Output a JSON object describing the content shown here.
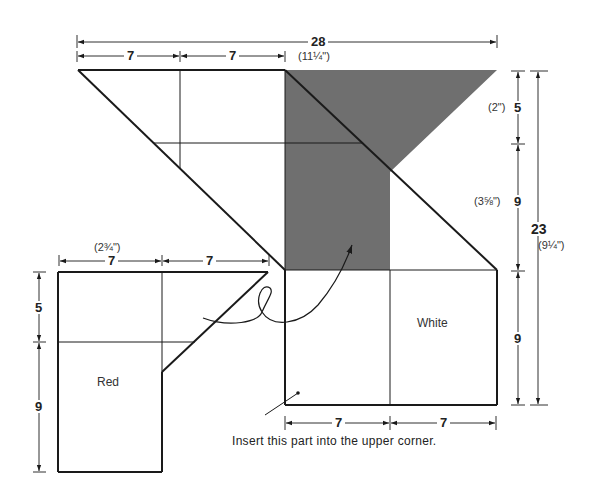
{
  "diagram": {
    "colors": {
      "line": "#1a1a1a",
      "shaded": "#6f6f6f",
      "background": "#ffffff"
    },
    "dimensions": {
      "top_total": "28",
      "top_total_inches": "(11¼\")",
      "top_left_segment": "7",
      "top_right_segment": "7",
      "right_upper": "5",
      "right_upper_inches": "(2\")",
      "right_middle": "9",
      "right_middle_inches": "(3⅝\")",
      "right_total": "23",
      "right_total_inches": "(9¼\")",
      "right_lower": "9",
      "red_top_left": "7",
      "red_top_right": "7",
      "red_top_inches": "(2¾\")",
      "red_left_upper": "5",
      "red_left_lower": "9",
      "white_bottom_left": "7",
      "white_bottom_right": "7"
    },
    "parts": {
      "red_label": "Red",
      "white_label": "White"
    },
    "note": "Insert this part into the upper corner."
  }
}
